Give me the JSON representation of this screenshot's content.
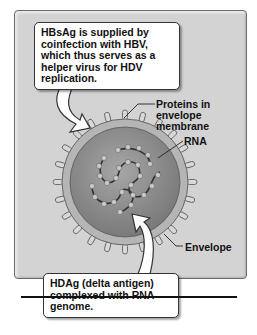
{
  "figure": {
    "callouts": {
      "hbsag": "HBsAg is supplied by coinfection with HBV, which thus serves as a helper virus for HDV replication.",
      "hdag": "HDAg (delta antigen) complexed with RNA genome."
    },
    "labels": {
      "proteins": "Proteins in envelope membrane",
      "rna": "RNA",
      "envelope": "Envelope"
    },
    "colors": {
      "panel_bg": "#d3d3d3",
      "virion_core": "#8e8e8e",
      "envelope_ring": "#b5b5b5",
      "callout_bg": "#ffffff",
      "text": "#111111"
    }
  }
}
